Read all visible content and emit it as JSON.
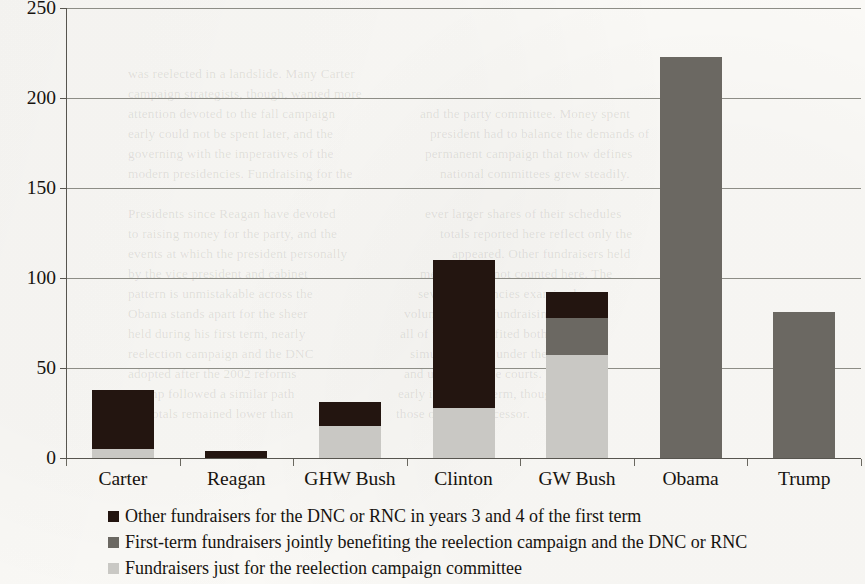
{
  "chart_data": {
    "type": "bar",
    "stacked": true,
    "title": "",
    "subtitle": "",
    "xlabel": "",
    "ylabel": "",
    "ylim": [
      0,
      250
    ],
    "ytick_values": [
      250,
      200,
      150,
      100,
      50,
      0
    ],
    "ytick_labels": [
      "250",
      "200",
      "150",
      "100",
      "50",
      "0"
    ],
    "grid": true,
    "grid_axis": "y",
    "legend_position": "bottom",
    "categories": [
      "Carter",
      "Reagan",
      "GHW Bush",
      "Clinton",
      "GW Bush",
      "Obama",
      "Trump"
    ],
    "series": [
      {
        "name": "Fundraisers just for the reelection campaign committee",
        "color": "#c9c8c4",
        "values": [
          5,
          0,
          18,
          28,
          57,
          0,
          0
        ]
      },
      {
        "name": "First-term fundraisers jointly benefiting the reelection campaign and the DNC or RNC",
        "color": "#6b6862",
        "values": [
          0,
          0,
          0,
          0,
          21,
          223,
          81
        ]
      },
      {
        "name": "Other fundraisers for the DNC or RNC in years 3 and 4 of the first term",
        "color": "#231510",
        "values": [
          33,
          4,
          13,
          82,
          14,
          0,
          0
        ]
      }
    ],
    "totals": [
      38,
      4,
      31,
      110,
      92,
      223,
      81
    ]
  },
  "legend": {
    "items": [
      {
        "label": "Other fundraisers for the DNC or RNC in years 3 and 4 of the first term",
        "color": "#231510"
      },
      {
        "label": "First-term fundraisers jointly benefiting the reelection campaign and the DNC or RNC",
        "color": "#6b6862"
      },
      {
        "label": "Fundraisers just for the reelection campaign committee",
        "color": "#c9c8c4"
      }
    ]
  },
  "background_bleed": [
    {
      "text": "was reelected in a landslide. Many Carter",
      "x": 128,
      "y": 66
    },
    {
      "text": "campaign strategists, though, wanted more",
      "x": 128,
      "y": 86
    },
    {
      "text": "attention devoted to the fall campaign",
      "x": 128,
      "y": 106
    },
    {
      "text": "and the party committee. Money spent",
      "x": 420,
      "y": 106
    },
    {
      "text": "early could not be spent later, and the",
      "x": 128,
      "y": 126
    },
    {
      "text": "president had to balance the demands of",
      "x": 430,
      "y": 126
    },
    {
      "text": "governing with the imperatives of the",
      "x": 128,
      "y": 146
    },
    {
      "text": "permanent campaign that now defines",
      "x": 425,
      "y": 146
    },
    {
      "text": "modern presidencies. Fundraising for the",
      "x": 128,
      "y": 166
    },
    {
      "text": "national committees grew steadily.",
      "x": 440,
      "y": 166
    },
    {
      "text": "Presidents since Reagan have devoted",
      "x": 128,
      "y": 206
    },
    {
      "text": "ever larger shares of their schedules",
      "x": 425,
      "y": 206
    },
    {
      "text": "to raising money for the party, and the",
      "x": 128,
      "y": 226
    },
    {
      "text": "totals reported here reflect only the",
      "x": 440,
      "y": 226
    },
    {
      "text": "events at which the president personally",
      "x": 128,
      "y": 246
    },
    {
      "text": "appeared. Other fundraisers held",
      "x": 452,
      "y": 246
    },
    {
      "text": "by the vice president and cabinet",
      "x": 128,
      "y": 266
    },
    {
      "text": "members are not counted here. The",
      "x": 420,
      "y": 266
    },
    {
      "text": "pattern is unmistakable across the",
      "x": 128,
      "y": 286
    },
    {
      "text": "seven presidencies examined.",
      "x": 418,
      "y": 286
    },
    {
      "text": "Obama stands apart for the sheer",
      "x": 128,
      "y": 306
    },
    {
      "text": "volume of joint fundraising events",
      "x": 404,
      "y": 306
    },
    {
      "text": "held during his first term, nearly",
      "x": 128,
      "y": 326
    },
    {
      "text": "all of which benefited both his",
      "x": 400,
      "y": 326
    },
    {
      "text": "reelection campaign and the DNC",
      "x": 128,
      "y": 346
    },
    {
      "text": "simultaneously under the rules",
      "x": 410,
      "y": 346
    },
    {
      "text": "adopted after the 2002 reforms",
      "x": 128,
      "y": 366
    },
    {
      "text": "and upheld by the courts.",
      "x": 404,
      "y": 366
    },
    {
      "text": "Trump followed a similar path",
      "x": 128,
      "y": 386
    },
    {
      "text": "early in his first term, though",
      "x": 398,
      "y": 386
    },
    {
      "text": "the totals remained lower than",
      "x": 128,
      "y": 406
    },
    {
      "text": "those of his predecessor.",
      "x": 396,
      "y": 406
    }
  ]
}
